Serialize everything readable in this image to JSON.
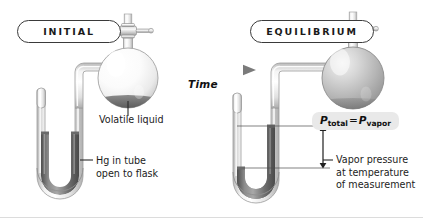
{
  "figure": {
    "kind": "vapor-pressure-manometer-diagram",
    "background_color": "#ffffff"
  },
  "panels": {
    "left": {
      "badge_label": "INITIAL",
      "flask_state": "clear-empty-with-liquid-pool",
      "manometer": "mercury level equal in both arms",
      "labels": [
        {
          "name": "volatile-liquid",
          "text": "Volatile liquid"
        },
        {
          "name": "hg-in-tube",
          "text": "Hg in tube\nopen to flask"
        }
      ]
    },
    "right": {
      "badge_label": "EQUILIBRIUM",
      "flask_state": "gray-filled-with-vapor",
      "manometer": "mercury displaced, right arm high / left arm low",
      "labels": [
        {
          "name": "vapor-pressure",
          "text": "Vapor pressure\nat temperature\nof measurement"
        }
      ],
      "pressure_tag": {
        "p": "P",
        "sub_total": "total",
        "equals": "=",
        "sub_vapor": "vapor",
        "plain_text": "P total = P vapor"
      }
    }
  },
  "transition": {
    "arrow_label": "Time",
    "direction": "left-to-right"
  },
  "colors": {
    "glass_outline": "#9a9a9a",
    "glass_light": "#ffffff",
    "mercury_dark": "#5e5e5e",
    "mercury_light": "#9d9d9d",
    "vapor_fill": "#b8b8b8",
    "liquid_pool": "#6e6e6e",
    "ink": "#1c1c1c",
    "tag_background": "#e9e9e9",
    "arrow_gray": "#8e8e8e"
  }
}
